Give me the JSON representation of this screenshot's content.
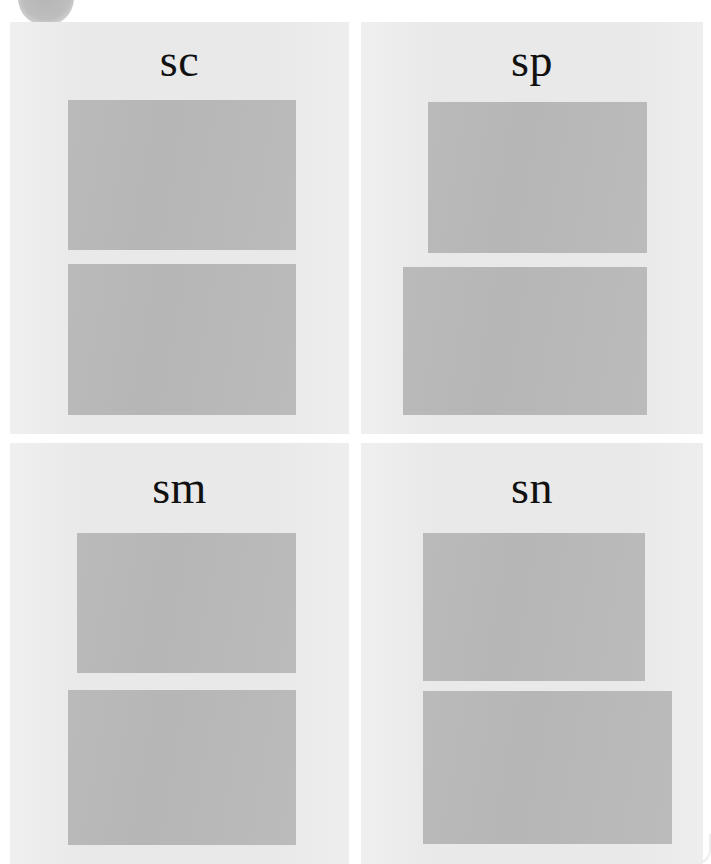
{
  "figure": {
    "type": "panel-grid",
    "background_color": "#ffffff",
    "panel_background_color": "#e9e9e9",
    "band_color": "#b6b6b6",
    "label_color": "#111111",
    "rows": 2,
    "columns": 2,
    "corner_mark": {
      "name": "page-corner-circle",
      "shape": "circle",
      "color": "#a8a8a8"
    },
    "panels": [
      {
        "id": "sc",
        "label": "sc",
        "position": "top-left",
        "bands": [
          {
            "name": "upper-band",
            "color": "#b6b6b6"
          },
          {
            "name": "lower-band",
            "color": "#b6b6b6"
          }
        ]
      },
      {
        "id": "sp",
        "label": "sp",
        "position": "top-right",
        "bands": [
          {
            "name": "upper-band",
            "color": "#b6b6b6"
          },
          {
            "name": "lower-band",
            "color": "#b6b6b6"
          }
        ]
      },
      {
        "id": "sm",
        "label": "sm",
        "position": "bottom-left",
        "bands": [
          {
            "name": "upper-band",
            "color": "#b6b6b6"
          },
          {
            "name": "lower-band",
            "color": "#b6b6b6"
          }
        ]
      },
      {
        "id": "sn",
        "label": "sn",
        "position": "bottom-right",
        "bands": [
          {
            "name": "upper-band",
            "color": "#b6b6b6"
          },
          {
            "name": "lower-band",
            "color": "#b6b6b6"
          }
        ]
      }
    ]
  }
}
